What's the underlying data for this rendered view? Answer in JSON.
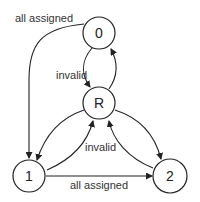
{
  "diagram": {
    "type": "state-machine",
    "nodes": [
      {
        "id": "0",
        "label": "0",
        "cx": 99,
        "cy": 33
      },
      {
        "id": "R",
        "label": "R",
        "cx": 99,
        "cy": 103
      },
      {
        "id": "1",
        "label": "1",
        "cx": 29,
        "cy": 176
      },
      {
        "id": "2",
        "label": "2",
        "cx": 170,
        "cy": 176
      }
    ],
    "edges": [
      {
        "from": "0",
        "to": "1",
        "label": "all assigned"
      },
      {
        "from": "0",
        "to": "R",
        "label": "invalid"
      },
      {
        "from": "R",
        "to": "0",
        "label": ""
      },
      {
        "from": "R",
        "to": "1",
        "label": ""
      },
      {
        "from": "1",
        "to": "R",
        "label": "invalid"
      },
      {
        "from": "R",
        "to": "2",
        "label": ""
      },
      {
        "from": "2",
        "to": "R",
        "label": ""
      },
      {
        "from": "1",
        "to": "2",
        "label": "all assigned"
      }
    ],
    "labels": {
      "edge_0_1": "all assigned",
      "edge_0_R": "invalid",
      "edge_1_R": "invalid",
      "edge_1_2": "all assigned"
    }
  }
}
